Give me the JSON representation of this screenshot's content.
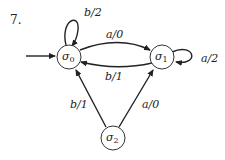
{
  "problem_number": "7.",
  "states": [
    {
      "id": "s0",
      "label": "σ0",
      "base": "σ",
      "sub": "0",
      "start": true
    },
    {
      "id": "s1",
      "label": "σ1",
      "base": "σ",
      "sub": "1",
      "start": false
    },
    {
      "id": "s2",
      "label": "σ2",
      "base": "σ",
      "sub": "2",
      "start": false
    }
  ],
  "transitions": [
    {
      "from": "s0",
      "to": "s0",
      "label": "b/2"
    },
    {
      "from": "s0",
      "to": "s1",
      "label": "a/0"
    },
    {
      "from": "s1",
      "to": "s0",
      "label": "b/1"
    },
    {
      "from": "s1",
      "to": "s1",
      "label": "a/2"
    },
    {
      "from": "s2",
      "to": "s0",
      "label": "b/1"
    },
    {
      "from": "s2",
      "to": "s1",
      "label": "a/0"
    }
  ]
}
